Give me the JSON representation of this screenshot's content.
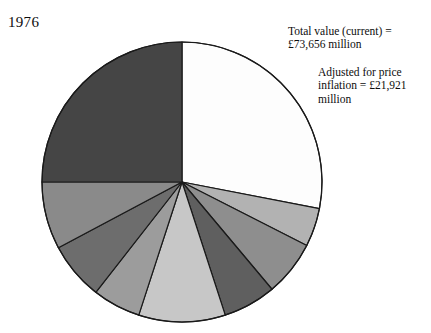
{
  "year_label": "1976",
  "annotations": [
    {
      "id": "total-value",
      "text": "Total value (current) =\n£73,656 million"
    },
    {
      "id": "adjusted-value",
      "text": "Adjusted for price\ninflation = £21,921\nmillion"
    }
  ],
  "chart_data": {
    "type": "pie",
    "title": "1976",
    "xlabel": "",
    "ylabel": "",
    "grid": false,
    "legend": "none",
    "start_angle_deg": 0,
    "direction": "clockwise",
    "center": {
      "x": 182,
      "y": 182
    },
    "radius": 140,
    "outline_color": "#1a1a1a",
    "outline_width": 1.2,
    "total_value_current": "£73,656 million",
    "total_value_adjusted_for_inflation": "£21,921 million",
    "slices": [
      {
        "label": "slice-1",
        "start_deg": 0,
        "end_deg": 101,
        "sweep_deg": 101,
        "percent": 28.1,
        "color": "#fdfdfd"
      },
      {
        "label": "slice-2",
        "start_deg": 101,
        "end_deg": 117,
        "sweep_deg": 16,
        "percent": 4.4,
        "color": "#b2b2b2"
      },
      {
        "label": "slice-3",
        "start_deg": 117,
        "end_deg": 140,
        "sweep_deg": 23,
        "percent": 6.4,
        "color": "#8e8e8e"
      },
      {
        "label": "slice-4",
        "start_deg": 140,
        "end_deg": 162,
        "sweep_deg": 22,
        "percent": 6.1,
        "color": "#5f5f5f"
      },
      {
        "label": "slice-5",
        "start_deg": 162,
        "end_deg": 198,
        "sweep_deg": 36,
        "percent": 10.0,
        "color": "#c7c7c7"
      },
      {
        "label": "slice-6",
        "start_deg": 198,
        "end_deg": 218,
        "sweep_deg": 20,
        "percent": 5.6,
        "color": "#9c9c9c"
      },
      {
        "label": "slice-7",
        "start_deg": 218,
        "end_deg": 242,
        "sweep_deg": 24,
        "percent": 6.7,
        "color": "#6d6d6d"
      },
      {
        "label": "slice-8",
        "start_deg": 242,
        "end_deg": 270,
        "sweep_deg": 28,
        "percent": 7.8,
        "color": "#8a8a8a"
      },
      {
        "label": "slice-9",
        "start_deg": 270,
        "end_deg": 360,
        "sweep_deg": 90,
        "percent": 25.0,
        "color": "#454545"
      }
    ]
  }
}
